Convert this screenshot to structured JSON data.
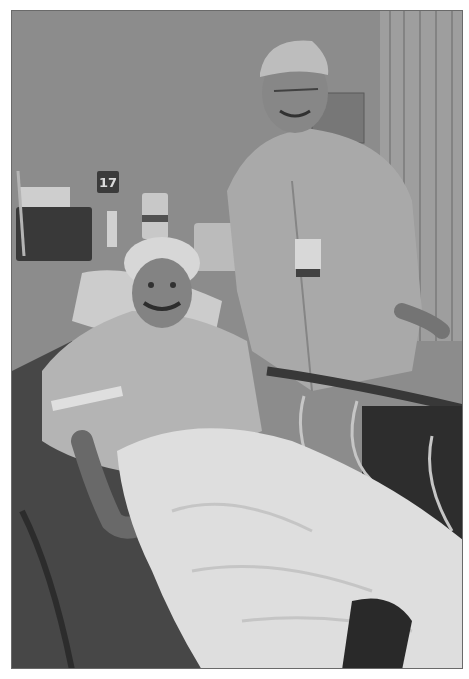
{
  "image": {
    "description": "Grayscale photo: a patient in a hospital bed wearing a surgical cap gives a thumbs-up beside a smiling surgeon in scrubs and cap",
    "palette": {
      "wall": "#929292",
      "dark": "#3a3a3a",
      "blanket": "#e8e8e8",
      "scrubs": "#b4b4b4",
      "border": "#6a6a6a"
    }
  },
  "scene": {
    "room_sign": "17",
    "subjects": [
      "patient",
      "surgeon"
    ],
    "objects": [
      "hospital-bed",
      "blanket",
      "pillow",
      "wall-bin",
      "hand-sanitizer",
      "wall-dispenser",
      "monitor",
      "iv-tubing",
      "curtain",
      "bed-rail"
    ]
  }
}
